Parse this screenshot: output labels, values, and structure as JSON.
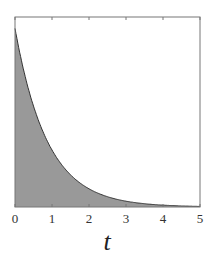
{
  "chart_data": {
    "type": "area",
    "title": "",
    "xlabel": "t",
    "ylabel": "",
    "xlim": [
      0,
      5
    ],
    "ylim": [
      0,
      1
    ],
    "x_ticks": [
      "0",
      "1",
      "2",
      "3",
      "4",
      "5"
    ],
    "y_ticks": [],
    "grid": false,
    "legend": null,
    "series": [
      {
        "name": "exponential decay",
        "x": [
          0,
          0.5,
          1,
          1.5,
          2,
          2.5,
          3,
          3.5,
          4,
          4.5,
          5
        ],
        "values": [
          0.94,
          0.53,
          0.3,
          0.17,
          0.095,
          0.053,
          0.03,
          0.017,
          0.009,
          0.005,
          0.003
        ]
      }
    ],
    "fill_color": "#999999",
    "line_color": "#333333"
  }
}
